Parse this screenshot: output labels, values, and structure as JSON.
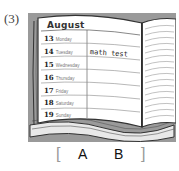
{
  "question_number": "(3)",
  "planner": {
    "month": "August",
    "days": [
      {
        "date": "13",
        "weekday": "Monday",
        "entry": ""
      },
      {
        "date": "14",
        "weekday": "Tuesday",
        "entry": "math test"
      },
      {
        "date": "15",
        "weekday": "Wednesday",
        "entry": ""
      },
      {
        "date": "16",
        "weekday": "Thursday",
        "entry": ""
      },
      {
        "date": "17",
        "weekday": "Friday",
        "entry": ""
      },
      {
        "date": "18",
        "weekday": "Saturday",
        "entry": ""
      },
      {
        "date": "19",
        "weekday": "Sunday",
        "entry": ""
      }
    ]
  },
  "answer_choices": {
    "open_bracket": "[",
    "option_a": "A",
    "option_b": "B",
    "close_bracket": "]"
  },
  "colors": {
    "frame_gray": "#9a9a9a",
    "page": "#ffffff",
    "ink": "#333333"
  }
}
